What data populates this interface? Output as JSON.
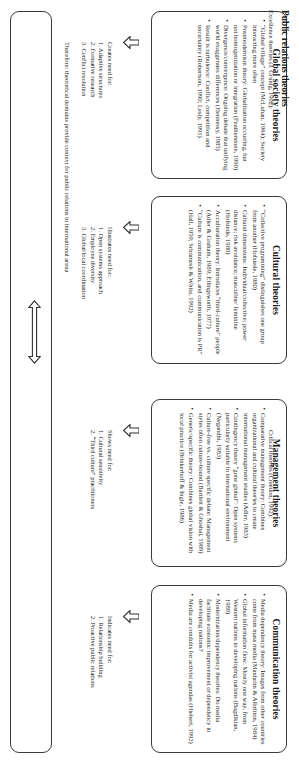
{
  "diagram": {
    "orientation": "rotated-90-clockwise",
    "ink_color": "#3a3a3a",
    "page_background": "#ffffff"
  },
  "boxes": [
    {
      "id": "global-society",
      "title": "Global society theories",
      "bullets": [
        "“Global village” concept (McLuhan, 1964): Society interacting more often",
        "Postmodernism theory: Globalization occurring, but not homogenization or integration (Featherstone, 1990)",
        "Divergence/convergence: Ongoing debate that unifying world exaggerates differences (Hennessy, 1985)",
        "Result is turbulence: Conflict, competition and uncertainty (Robertson, 1990; Lesly, 1991)"
      ]
    },
    {
      "id": "cultural",
      "title": "Cultural theories",
      "bullets": [
        "“Collective programming” distinguishes one group from another (Hofstede, 1980)",
        "Cultural dimensions: Individual/collective; power distance; risk avoidance; masculine/ feminine (Hofstede, 1980)",
        "Acculturation theory: Introduces “third-culture” people (Adler & Graham, 1989; Ellingsworth, 1977)",
        "“Culture is communication, and communication is PR” (Hall, 1959; Sriramesh & White, 1992)"
      ]
    },
    {
      "id": "management",
      "title": "Management theories",
      "bullets": [
        "Comparative management theory: Combines organizational and cultural theories to create international management studies (Adler, 1983)",
        "Contingency theory “gone global”: Open systems particularly suitable in international environment (Negandhi, 1983)",
        "Culture-free vs. culture specific debate: Management styles often culture-bound (Bartlett & Ghoshal, 1989)",
        "Generic/specific theory: Combines global vision with local practice (Brinkerhoff & Ingle, 1986)"
      ]
    },
    {
      "id": "communication",
      "title": "Communication theories",
      "bullets": [
        "Media dependency theory: Images from other countries come from mass media (Manheim & Albritton, 1984)",
        "Global information flow: Mostly one way, from Western nations to developing nations (Bagdikian, 1989)",
        "Modernization/dependency theories: Do media facilitate economic improvement or dependency in developing nations?",
        "Media are conduits for activist agendas (Hiebert, 1992)"
      ]
    }
  ],
  "needs": [
    {
      "id": "global-society",
      "head": "Creates need for:",
      "items": [
        "1. Adaptive structures",
        "2. Formative research",
        "3. Conflict resolution"
      ]
    },
    {
      "id": "cultural",
      "head": "Illustrates need for:",
      "items": [
        "1. Open systems approach",
        "2. Employee diversity",
        "3. Global/local coordination"
      ]
    },
    {
      "id": "management",
      "head": "Shows need for:",
      "items": [
        "1. Cultural sensitivity",
        "2. “Third culture” practitioners"
      ]
    },
    {
      "id": "communication",
      "head": "Indicates need for:",
      "items": [
        "1. Relationship building",
        "2. Proactive public relations"
      ]
    }
  ],
  "therefore": "Therefore: theoretical domains provide context for public relations in international arena",
  "pr_box": {
    "title": "Public relations theories",
    "left_text": "Excellence theories (J. Grunig, 1992):",
    "right_text": "Critical theories (Creedon, 1992):"
  },
  "icons": {
    "down_arrow": "down-arrow-icon",
    "double_arrow": "double-headed-arrow-icon"
  }
}
